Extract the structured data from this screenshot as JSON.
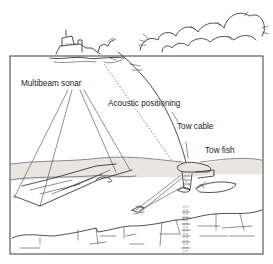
{
  "diagram": {
    "labels": {
      "multibeam_sonar": "Multibeam sonar",
      "acoustic_positioning": "Acoustic positioning",
      "tow_cable": "Tow cable",
      "tow_fish": "Tow fish"
    },
    "elements": [
      "clouds",
      "survey-ship",
      "water-column-frame",
      "multibeam-swath",
      "acoustic-positioning-path",
      "tow-cable",
      "tow-fish",
      "side-scan-beams",
      "seafloor",
      "sub-bottom-profile"
    ],
    "colors": {
      "ink": "#222222",
      "sediment": "#e9e6e0",
      "background": "#ffffff"
    }
  }
}
